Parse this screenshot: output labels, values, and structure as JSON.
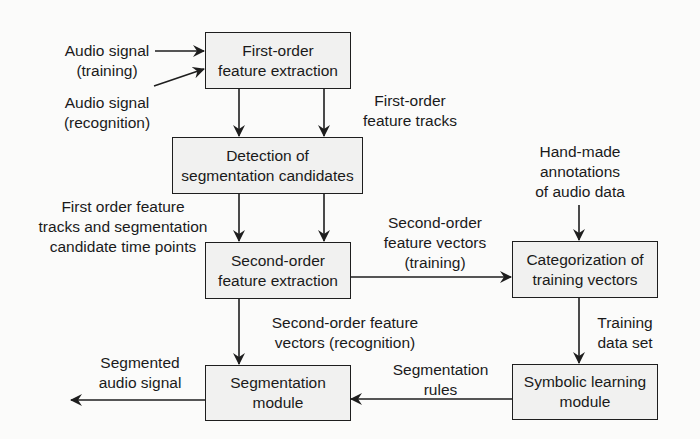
{
  "diagram": {
    "boxes": {
      "first_order": {
        "lines": [
          "First-order",
          "feature extraction"
        ]
      },
      "detection": {
        "lines": [
          "Detection of",
          "segmentation candidates"
        ]
      },
      "second_order": {
        "lines": [
          "Second-order",
          "feature extraction"
        ]
      },
      "segmentation": {
        "lines": [
          "Segmentation",
          "module"
        ]
      },
      "categorization": {
        "lines": [
          "Categorization of",
          "training vectors"
        ]
      },
      "symbolic": {
        "lines": [
          "Symbolic learning",
          "module"
        ]
      }
    },
    "labels": {
      "audio_training": [
        "Audio signal",
        "(training)"
      ],
      "audio_recognition": [
        "Audio signal",
        "(recognition)"
      ],
      "first_order_tracks": [
        "First-order",
        "feature tracks"
      ],
      "hand_made": [
        "Hand-made",
        "annotations",
        "of audio data"
      ],
      "tracks_and_candidates": [
        "First order feature",
        "tracks and segmentation",
        "candidate time points"
      ],
      "second_order_training": [
        "Second-order",
        "feature vectors",
        "(training)"
      ],
      "second_order_recognition": [
        "Second-order feature",
        "vectors (recognition)"
      ],
      "training_data_set": [
        "Training",
        "data set"
      ],
      "segmented_audio": [
        "Segmented",
        "audio signal"
      ],
      "segmentation_rules": [
        "Segmentation",
        "rules"
      ]
    },
    "colors": {
      "line": "#1e1e1e",
      "box_fill": "#f1f1f0",
      "background": "#fbfbfa"
    }
  }
}
